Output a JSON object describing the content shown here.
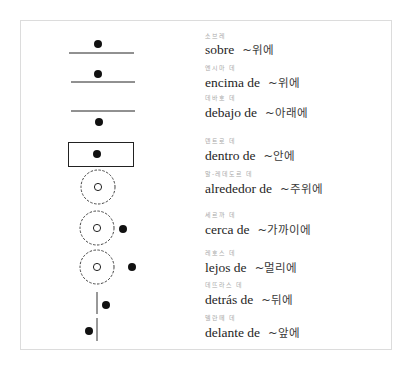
{
  "rows": [
    {
      "pron": "소브레",
      "es": "sobre",
      "ko": "~위에",
      "diagram": "dot-above-line",
      "y": 44
    },
    {
      "pron": "엔시마   데",
      "es": "encima de",
      "ko": "~위에",
      "diagram": "dot-above-line",
      "y": 76
    },
    {
      "pron": "데바호   데",
      "es": "debajo de",
      "ko": "~아래에",
      "diagram": "dot-below-line",
      "y": 105
    },
    {
      "pron": "덴트로   데",
      "es": "dentro de",
      "ko": "~안에",
      "diagram": "dot-inside-box",
      "y": 148
    },
    {
      "pron": "알-레데도르   데",
      "es": "alrededor de",
      "ko": "~주위에",
      "diagram": "dashed-circle-around",
      "y": 180
    },
    {
      "pron": "세르까   데",
      "es": "cerca de",
      "ko": "~가까이에",
      "diagram": "dot-near-circle",
      "y": 220
    },
    {
      "pron": "레호스   데",
      "es": "lejos de",
      "ko": "~멀리에",
      "diagram": "dot-far-from-circle",
      "y": 259
    },
    {
      "pron": "데뜨라스   데",
      "es": "detrás de",
      "ko": "~뒤에",
      "diagram": "dot-behind-line",
      "y": 291
    },
    {
      "pron": "델란떼   데",
      "es": "delante de",
      "ko": "~앞에",
      "diagram": "dot-in-front-of-line",
      "y": 324
    }
  ],
  "colors": {
    "ink": "#1a1a1a",
    "frame": "#dcdcdc",
    "pron": "#a8a8a8"
  }
}
